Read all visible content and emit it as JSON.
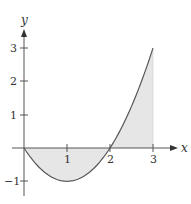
{
  "chart_data": {
    "type": "area",
    "title": "",
    "function": "y = x^2 - 2x",
    "xlabel": "x",
    "ylabel": "y",
    "xlim": [
      -0.35,
      3.6
    ],
    "ylim": [
      -1.35,
      3.6
    ],
    "grid": false,
    "legend": null,
    "x_ticks": [
      1,
      2,
      3
    ],
    "x_tick_labels": [
      "1",
      "2",
      "3"
    ],
    "y_ticks": [
      -1,
      1,
      2,
      3
    ],
    "y_tick_labels": [
      "−1",
      "1",
      "2",
      "3"
    ],
    "x": [
      0,
      0.25,
      0.5,
      0.75,
      1,
      1.25,
      1.5,
      1.75,
      2,
      2.25,
      2.5,
      2.75,
      3
    ],
    "values": [
      0,
      -0.4375,
      -0.75,
      -0.9375,
      -1,
      -0.9375,
      -0.75,
      -0.4375,
      0,
      0.5625,
      1.25,
      2.0625,
      3
    ],
    "shaded_region": {
      "x_from": 0,
      "x_to": 3,
      "between": "curve and x-axis"
    },
    "colors": {
      "curve": "#555555",
      "fill": "#e6e6e6",
      "axes": "#555555"
    }
  },
  "labels": {
    "x_axis": "x",
    "y_axis": "y",
    "x_tick_1": "1",
    "x_tick_2": "2",
    "x_tick_3": "3",
    "y_tick_3": "3",
    "y_tick_2": "2",
    "y_tick_1": "1",
    "y_tick_m1": "−1"
  }
}
